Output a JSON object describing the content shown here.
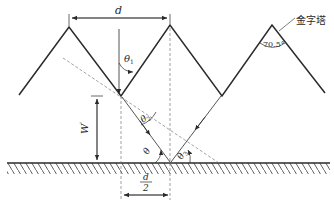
{
  "diagram": {
    "type": "pyramid-texture-light-reflection",
    "labels": {
      "period": "d",
      "half_period_num": "d",
      "half_period_den": "2",
      "height": "W",
      "height_prime": "'",
      "theta1": "θ",
      "theta1_sub": "1",
      "theta2": "θ",
      "theta2_sub": "2",
      "theta": "θ",
      "theta3": "θ",
      "theta3_sub": "3",
      "apex_angle": "70.5°",
      "pyramid_label": "金字塔"
    },
    "colors": {
      "line": "#2a2a2a",
      "dashed": "#7a7a7a",
      "background": "#ffffff"
    }
  }
}
